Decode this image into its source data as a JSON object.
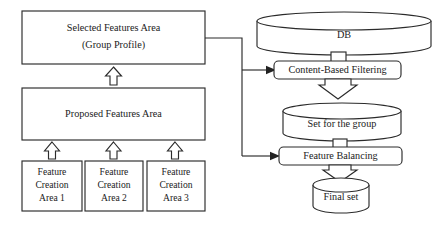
{
  "diagram": {
    "background_color": "#ffffff",
    "line_color": "#2b2b2b",
    "text_color": "#1b1b1b",
    "nodes": {
      "selected_features": {
        "label_line1": "Selected Features Area",
        "label_line2": "(Group Profile)",
        "shape": "rectangle"
      },
      "proposed_features": {
        "label": "Proposed Features Area",
        "shape": "rectangle"
      },
      "feature_creation_1": {
        "line1": "Feature",
        "line2": "Creation",
        "line3": "Area 1",
        "shape": "rectangle"
      },
      "feature_creation_2": {
        "line1": "Feature",
        "line2": "Creation",
        "line3": "Area 2",
        "shape": "rectangle"
      },
      "feature_creation_3": {
        "line1": "Feature",
        "line2": "Creation",
        "line3": "Area 3",
        "shape": "rectangle"
      },
      "db": {
        "label": "DB",
        "shape": "cylinder"
      },
      "content_based_filtering": {
        "label": "Content-Based Filtering",
        "shape": "rounded-rectangle"
      },
      "set_for_the_group": {
        "label": "Set for the group",
        "shape": "cylinder"
      },
      "feature_balancing": {
        "label": "Feature Balancing",
        "shape": "rounded-rectangle"
      },
      "final_set": {
        "label": "Final set",
        "shape": "cylinder"
      }
    },
    "connectors": [
      {
        "from": "proposed_features",
        "to": "selected_features",
        "style": "hollow-block-arrow-up"
      },
      {
        "from": "feature_creation_1",
        "to": "proposed_features",
        "style": "hollow-block-arrow-up"
      },
      {
        "from": "feature_creation_2",
        "to": "proposed_features",
        "style": "hollow-block-arrow-up"
      },
      {
        "from": "feature_creation_3",
        "to": "proposed_features",
        "style": "hollow-block-arrow-up"
      },
      {
        "from": "selected_features",
        "to": "content_based_filtering",
        "style": "line-solid-arrow"
      },
      {
        "from": "selected_features",
        "to": "feature_balancing",
        "style": "line-solid-arrow"
      },
      {
        "from": "db",
        "to": "content_based_filtering",
        "style": "connector-stub"
      },
      {
        "from": "content_based_filtering",
        "to": "set_for_the_group",
        "style": "hollow-block-arrow-down"
      },
      {
        "from": "set_for_the_group",
        "to": "feature_balancing",
        "style": "connector-stub"
      },
      {
        "from": "feature_balancing",
        "to": "final_set",
        "style": "hollow-block-arrow-down"
      }
    ]
  }
}
